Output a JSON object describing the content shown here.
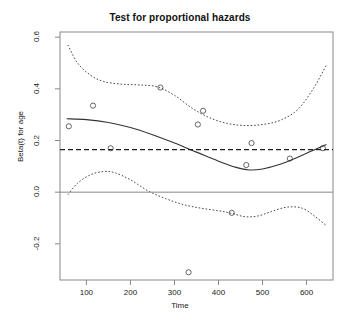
{
  "chart_data": {
    "type": "scatter",
    "title": "Test for proportional hazards",
    "xlabel": "Time",
    "ylabel": "Beta(t) for age",
    "xlim": [
      40,
      660
    ],
    "ylim": [
      -0.34,
      0.62
    ],
    "xticks": [
      100,
      200,
      300,
      400,
      500,
      600
    ],
    "xtick_labels": [
      "100",
      "200",
      "300",
      "400",
      "500",
      "600"
    ],
    "yticks": [
      -0.2,
      0.0,
      0.2,
      0.4,
      0.6
    ],
    "ytick_labels": [
      "-0.2",
      "0.0",
      "0.2",
      "0.4",
      "0.6"
    ],
    "grid": false,
    "legend": "none",
    "series": [
      {
        "name": "scaled Schoenfeld residuals",
        "type": "scatter",
        "marker": "open-circle",
        "points": [
          {
            "x": 60,
            "y": 0.255
          },
          {
            "x": 115,
            "y": 0.335
          },
          {
            "x": 155,
            "y": 0.17
          },
          {
            "x": 268,
            "y": 0.405
          },
          {
            "x": 332,
            "y": -0.31
          },
          {
            "x": 353,
            "y": 0.262
          },
          {
            "x": 365,
            "y": 0.315
          },
          {
            "x": 430,
            "y": -0.08
          },
          {
            "x": 463,
            "y": 0.105
          },
          {
            "x": 475,
            "y": 0.19
          },
          {
            "x": 562,
            "y": 0.13
          },
          {
            "x": 637,
            "y": 0.17
          }
        ]
      },
      {
        "name": "smoothed spline fit",
        "type": "line",
        "style": "solid",
        "points": [
          {
            "x": 55,
            "y": 0.284
          },
          {
            "x": 100,
            "y": 0.281
          },
          {
            "x": 150,
            "y": 0.27
          },
          {
            "x": 200,
            "y": 0.25
          },
          {
            "x": 250,
            "y": 0.222
          },
          {
            "x": 300,
            "y": 0.19
          },
          {
            "x": 350,
            "y": 0.155
          },
          {
            "x": 400,
            "y": 0.12
          },
          {
            "x": 440,
            "y": 0.096
          },
          {
            "x": 470,
            "y": 0.086
          },
          {
            "x": 500,
            "y": 0.09
          },
          {
            "x": 540,
            "y": 0.108
          },
          {
            "x": 580,
            "y": 0.135
          },
          {
            "x": 610,
            "y": 0.158
          },
          {
            "x": 645,
            "y": 0.185
          }
        ]
      },
      {
        "name": "upper confidence band",
        "type": "line",
        "style": "dotted",
        "points": [
          {
            "x": 58,
            "y": 0.57
          },
          {
            "x": 80,
            "y": 0.5
          },
          {
            "x": 110,
            "y": 0.452
          },
          {
            "x": 140,
            "y": 0.428
          },
          {
            "x": 180,
            "y": 0.418
          },
          {
            "x": 220,
            "y": 0.415
          },
          {
            "x": 260,
            "y": 0.408
          },
          {
            "x": 300,
            "y": 0.375
          },
          {
            "x": 340,
            "y": 0.325
          },
          {
            "x": 380,
            "y": 0.288
          },
          {
            "x": 420,
            "y": 0.266
          },
          {
            "x": 460,
            "y": 0.258
          },
          {
            "x": 500,
            "y": 0.262
          },
          {
            "x": 540,
            "y": 0.278
          },
          {
            "x": 580,
            "y": 0.32
          },
          {
            "x": 615,
            "y": 0.4
          },
          {
            "x": 645,
            "y": 0.492
          }
        ]
      },
      {
        "name": "lower confidence band",
        "type": "line",
        "style": "dotted",
        "points": [
          {
            "x": 58,
            "y": -0.01
          },
          {
            "x": 80,
            "y": 0.035
          },
          {
            "x": 110,
            "y": 0.068
          },
          {
            "x": 140,
            "y": 0.08
          },
          {
            "x": 165,
            "y": 0.075
          },
          {
            "x": 200,
            "y": 0.048
          },
          {
            "x": 240,
            "y": 0.005
          },
          {
            "x": 280,
            "y": -0.025
          },
          {
            "x": 320,
            "y": -0.048
          },
          {
            "x": 360,
            "y": -0.062
          },
          {
            "x": 400,
            "y": -0.072
          },
          {
            "x": 430,
            "y": -0.082
          },
          {
            "x": 460,
            "y": -0.095
          },
          {
            "x": 490,
            "y": -0.092
          },
          {
            "x": 520,
            "y": -0.075
          },
          {
            "x": 555,
            "y": -0.058
          },
          {
            "x": 590,
            "y": -0.062
          },
          {
            "x": 620,
            "y": -0.095
          },
          {
            "x": 645,
            "y": -0.13
          }
        ]
      },
      {
        "name": "overall beta reference",
        "type": "hline",
        "style": "dashed",
        "y": 0.165
      },
      {
        "name": "zero reference",
        "type": "hline",
        "style": "solid",
        "y": 0.0
      }
    ]
  }
}
